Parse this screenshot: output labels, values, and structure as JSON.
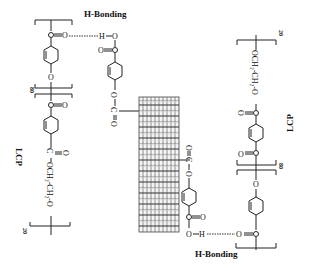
{
  "diagram": {
    "labels": {
      "h_bonding_top": "H-Bonding",
      "h_bonding_bottom": "H-Bonding",
      "lcp_left": "LCP",
      "lcp_right": "LCP",
      "repeat_left_inner": "80",
      "repeat_left_outer": "20",
      "repeat_right_inner": "80",
      "repeat_right_outer": "20"
    },
    "atoms": {
      "carbonyl_o": "O",
      "carbon": "C",
      "oxygen": "O",
      "hydrogen": "H",
      "ethylene_glycol": "OCH₂-CH₂-O",
      "ester_o": "O"
    },
    "components": [
      "left LCP chain (polyester with ethylene glycol spacer, n=20, m=80)",
      "right LCP chain (polyester with ethylene glycol spacer, n=20, m=80)",
      "carbon nanotube (center)",
      "top ester-linked benzoic acid graft",
      "bottom ester-linked benzoic acid graft",
      "top hydrogen bond (C=O···H-O)",
      "bottom hydrogen bond (O-H···O=C)"
    ],
    "colors": {
      "ink": "#222222",
      "background": "#ffffff",
      "nanotube": "#555555"
    }
  }
}
